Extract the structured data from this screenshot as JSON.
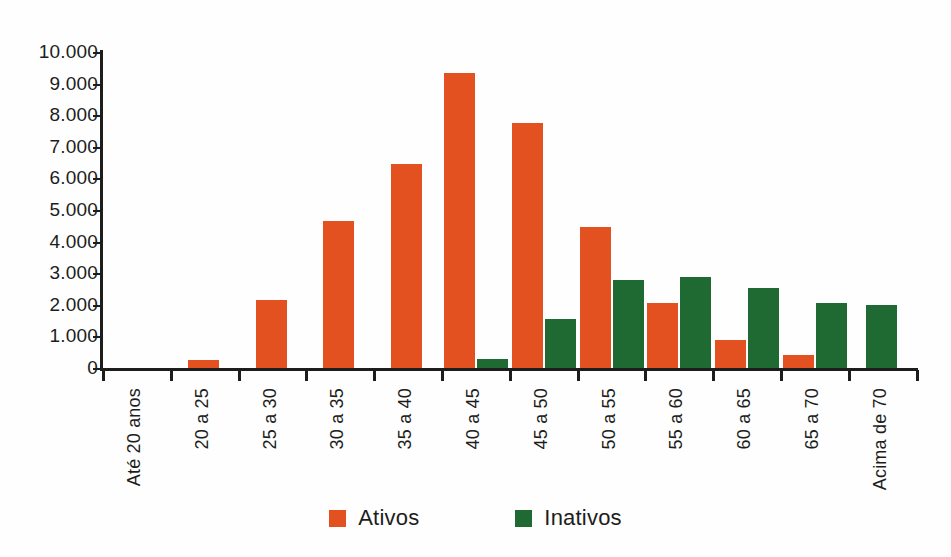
{
  "chart_data": {
    "type": "bar",
    "title": "",
    "subtitle": "",
    "xlabel": "",
    "ylabel": "",
    "ylim": [
      0,
      10000
    ],
    "grid": false,
    "legend_position": "bottom",
    "number_format": "pt-BR (dot thousands separator)",
    "categories": [
      "Até 20 anos",
      "20 a 25",
      "25 a 30",
      "30 a 35",
      "35 a 40",
      "40 a 45",
      "45 a 50",
      "50 a 55",
      "55 a 60",
      "60 a 65",
      "65 a 70",
      "Acima de 70"
    ],
    "ytick_labels": [
      "10.000",
      "9.000",
      "8.000",
      "7.000",
      "6.000",
      "5.000",
      "4.000",
      "3.000",
      "2.000",
      "1.000",
      "0"
    ],
    "ytick_values": [
      10000,
      9000,
      8000,
      7000,
      6000,
      5000,
      4000,
      3000,
      2000,
      1000,
      0
    ],
    "series": [
      {
        "name": "Ativos",
        "color": "#e2511f",
        "values": [
          0,
          250,
          2150,
          4650,
          6450,
          9350,
          7750,
          4450,
          2050,
          900,
          400,
          0
        ]
      },
      {
        "name": "Inativos",
        "color": "#1f6a33",
        "values": [
          0,
          0,
          0,
          0,
          0,
          300,
          1550,
          2800,
          2880,
          2520,
          2050,
          1980
        ]
      }
    ]
  },
  "legend": {
    "items": [
      {
        "label": "Ativos",
        "color": "#e2511f"
      },
      {
        "label": "Inativos",
        "color": "#1f6a33"
      }
    ]
  },
  "colors": {
    "ativos": "#e2511f",
    "inativos": "#1f6a33",
    "axis": "#1d1d1b",
    "background": "#ffffff"
  }
}
